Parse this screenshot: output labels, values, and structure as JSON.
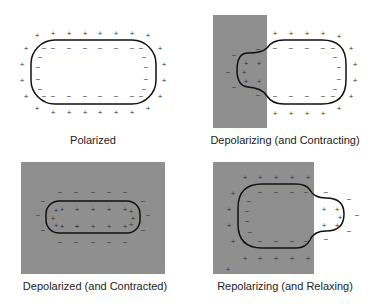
{
  "colors": {
    "depolarized_region": "#8f8f8f",
    "outline": "#111111",
    "charge": "#333333"
  },
  "panels": [
    {
      "label": "Polarized"
    },
    {
      "label": "Depolarizing (and Contracting)"
    },
    {
      "label": "Depolarized (and Contracted)"
    },
    {
      "label": "Repolarizing (and Relaxing)"
    }
  ],
  "charges": {
    "positive": "+",
    "negative": "−"
  }
}
